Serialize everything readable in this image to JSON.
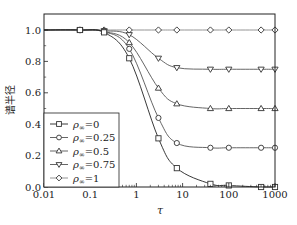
{
  "chart_data": {
    "type": "line",
    "title": "",
    "xlabel": "τ",
    "ylabel": "谱半径",
    "xscale": "log",
    "xlim": [
      0.01,
      1000
    ],
    "ylim": [
      0.0,
      1.08
    ],
    "xticks": [
      0.01,
      0.1,
      1,
      10,
      100,
      1000
    ],
    "xtick_labels": [
      "0.01",
      "0.1",
      "1",
      "10",
      "100",
      "1000"
    ],
    "yticks": [
      0.0,
      0.2,
      0.4,
      0.6,
      0.8,
      1.0
    ],
    "ytick_labels": [
      "0.0",
      "0.2",
      "0.4",
      "0.6",
      "0.8",
      "1.0"
    ],
    "grid": false,
    "legend_position": "lower left",
    "marker_x": [
      0.01,
      0.06,
      0.2,
      0.7,
      3,
      7.5,
      40,
      100,
      500,
      1000
    ],
    "series": [
      {
        "name": "ρ∞=0",
        "label_base": "ρ",
        "label_sub": "∞",
        "label_val": "=0",
        "marker": "square",
        "color": "#222222",
        "values": [
          1.0,
          1.0,
          0.985,
          0.82,
          0.31,
          0.12,
          0.02,
          0.01,
          0.0,
          0.0
        ]
      },
      {
        "name": "ρ∞=0.25",
        "label_base": "ρ",
        "label_sub": "∞",
        "label_val": "=0.25",
        "marker": "circle",
        "color": "#555555",
        "values": [
          1.0,
          1.0,
          0.99,
          0.88,
          0.44,
          0.28,
          0.25,
          0.25,
          0.25,
          0.25
        ]
      },
      {
        "name": "ρ∞=0.5",
        "label_base": "ρ",
        "label_sub": "∞",
        "label_val": "=0.5",
        "marker": "triangle-up",
        "color": "#555555",
        "values": [
          1.0,
          1.0,
          0.99,
          0.92,
          0.63,
          0.53,
          0.5,
          0.5,
          0.5,
          0.5
        ]
      },
      {
        "name": "ρ∞=0.75",
        "label_base": "ρ",
        "label_sub": "∞",
        "label_val": "=0.75",
        "marker": "triangle-down",
        "color": "#555555",
        "values": [
          1.0,
          1.0,
          0.995,
          0.97,
          0.82,
          0.76,
          0.75,
          0.75,
          0.75,
          0.75
        ]
      },
      {
        "name": "ρ∞=1",
        "label_base": "ρ",
        "label_sub": "∞",
        "label_val": "=1",
        "marker": "diamond",
        "color": "#888888",
        "values": [
          1.0,
          1.0,
          1.0,
          1.0,
          1.0,
          1.0,
          1.0,
          1.0,
          1.0,
          1.0
        ]
      }
    ]
  }
}
